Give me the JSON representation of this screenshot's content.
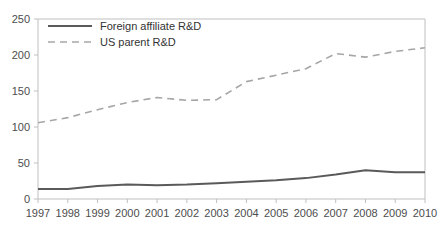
{
  "chart_data": {
    "type": "line",
    "title": "",
    "subtitle": "",
    "xlabel": "",
    "ylabel": "",
    "x": [
      1997,
      1998,
      1999,
      2000,
      2001,
      2002,
      2003,
      2004,
      2005,
      2006,
      2007,
      2008,
      2009,
      2010
    ],
    "categories": [
      "1997",
      "1998",
      "1999",
      "2000",
      "2001",
      "2002",
      "2003",
      "2004",
      "2005",
      "2006",
      "2007",
      "2008",
      "2009",
      "2010"
    ],
    "series": [
      {
        "name": "Foreign affiliate R&D",
        "style": "solid",
        "color": "#5a5a5a",
        "values": [
          14,
          14,
          18,
          20,
          19,
          20,
          22,
          24,
          26,
          29,
          34,
          40,
          37,
          37
        ]
      },
      {
        "name": "US parent R&D",
        "style": "dashed",
        "color": "#a6a6a6",
        "values": [
          106,
          113,
          124,
          134,
          141,
          137,
          138,
          163,
          172,
          181,
          202,
          197,
          205,
          210
        ]
      }
    ],
    "ylim": [
      0,
      250
    ],
    "yticks": [
      0,
      50,
      100,
      150,
      200,
      250
    ],
    "ytick_labels": [
      "0",
      "50",
      "100",
      "150",
      "200",
      "250"
    ],
    "xlim": [
      1997,
      2010
    ],
    "grid": false,
    "legend_position": "top-left-inside",
    "legend_entries": [
      {
        "label": "Foreign affiliate R&D",
        "style": "solid",
        "color": "#5a5a5a"
      },
      {
        "label": "US parent R&D",
        "style": "dashed",
        "color": "#a6a6a6"
      }
    ],
    "axis_color": "#bfbfbf"
  }
}
